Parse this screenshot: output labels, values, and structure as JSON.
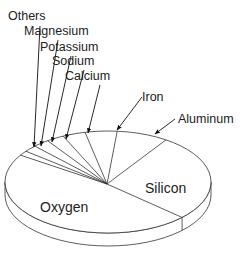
{
  "chart_data": {
    "type": "pie",
    "title": "",
    "style": "3d-tilted",
    "slices": [
      {
        "label": "Oxygen",
        "value": 46.6
      },
      {
        "label": "Silicon",
        "value": 27.7
      },
      {
        "label": "Aluminum",
        "value": 8.1
      },
      {
        "label": "Iron",
        "value": 5.0
      },
      {
        "label": "Calcium",
        "value": 3.6
      },
      {
        "label": "Sodium",
        "value": 2.8
      },
      {
        "label": "Potassium",
        "value": 2.6
      },
      {
        "label": "Magnesium",
        "value": 2.1
      },
      {
        "label": "Others",
        "value": 1.5
      }
    ],
    "inside_labels": [
      "Oxygen",
      "Silicon"
    ],
    "callout_labels": [
      "Others",
      "Magnesium",
      "Potassium",
      "Sodium",
      "Calcium",
      "Iron",
      "Aluminum"
    ],
    "colors": {
      "stroke": "#333333",
      "fill": "#ffffff",
      "text": "#222222"
    }
  }
}
